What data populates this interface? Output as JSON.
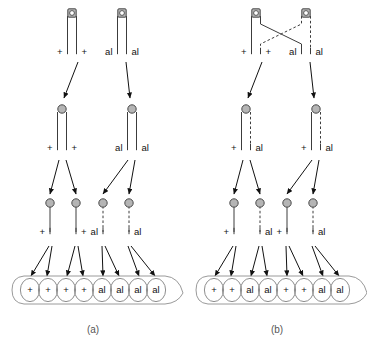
{
  "figure": {
    "alleles": {
      "wild": "+",
      "mutant": "al"
    },
    "colors": {
      "line": "#3c3c3c",
      "centromere_fill": "#b5b5b5",
      "centromere_stroke": "#4a4a4a",
      "spore_stroke": "#8e8e8e",
      "ascus_stroke": "#9a9a9a",
      "arrow": "#111111",
      "text": "#111111",
      "caption": "#555555",
      "background": "#ffffff"
    }
  },
  "panels": [
    {
      "id": "a",
      "caption": "(a)",
      "description": "First-division segregation, no crossing over",
      "crossover": false,
      "row1": {
        "chromosomes": [
          {
            "id": "a-r1-left",
            "chromatids": [
              {
                "style": "solid",
                "label": "+"
              },
              {
                "style": "solid",
                "label": "+"
              }
            ]
          },
          {
            "id": "a-r1-right",
            "chromatids": [
              {
                "style": "solid",
                "label": "al"
              },
              {
                "style": "solid",
                "label": "al"
              }
            ]
          }
        ]
      },
      "row2": {
        "chromosomes": [
          {
            "id": "a-r2-left",
            "chromatids": [
              {
                "style": "solid",
                "label": "+"
              },
              {
                "style": "solid",
                "label": "+"
              }
            ]
          },
          {
            "id": "a-r2-right",
            "chromatids": [
              {
                "style": "solid",
                "label": "al"
              },
              {
                "style": "solid",
                "label": "al"
              }
            ]
          }
        ]
      },
      "row3": {
        "chromatids": [
          {
            "style": "solid",
            "label": "+"
          },
          {
            "style": "solid",
            "label": "+"
          },
          {
            "style": "dashed",
            "label": "al"
          },
          {
            "style": "dashed",
            "label": "al"
          }
        ]
      },
      "ascus": {
        "spores": [
          "+",
          "+",
          "+",
          "+",
          "al",
          "al",
          "al",
          "al"
        ]
      }
    },
    {
      "id": "b",
      "caption": "(b)",
      "description": "Second-division segregation, crossing over between inner chromatids",
      "crossover": true,
      "row1": {
        "chromosomes": [
          {
            "id": "b-r1-left",
            "chromatids": [
              {
                "style": "solid",
                "label": "+"
              },
              {
                "style": "solid",
                "label": "+"
              }
            ]
          },
          {
            "id": "b-r1-right",
            "chromatids": [
              {
                "style": "dashed",
                "label": "al"
              },
              {
                "style": "dashed",
                "label": "al"
              }
            ]
          }
        ]
      },
      "row2": {
        "chromosomes": [
          {
            "id": "b-r2-left",
            "chromatids": [
              {
                "style": "solid",
                "label": "+"
              },
              {
                "style": "dashed",
                "label": "al"
              }
            ]
          },
          {
            "id": "b-r2-right",
            "chromatids": [
              {
                "style": "solid",
                "label": "+"
              },
              {
                "style": "dashed",
                "label": "al"
              }
            ]
          }
        ]
      },
      "row3": {
        "chromatids": [
          {
            "style": "solid",
            "label": "+"
          },
          {
            "style": "dashed",
            "label": "al"
          },
          {
            "style": "solid",
            "label": "+"
          },
          {
            "style": "dashed",
            "label": "al"
          }
        ]
      },
      "ascus": {
        "spores": [
          "+",
          "+",
          "al",
          "al",
          "+",
          "+",
          "al",
          "al"
        ]
      }
    }
  ]
}
